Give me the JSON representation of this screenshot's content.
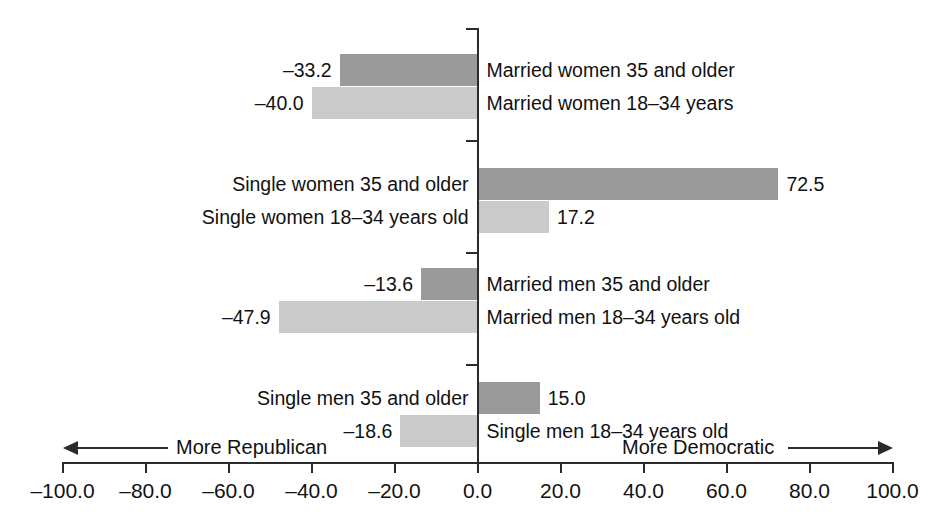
{
  "chart_data": {
    "type": "bar",
    "title": "",
    "subtitle": "",
    "xlabel": "",
    "ylabel": "",
    "orientation": "horizontal",
    "grid": false,
    "legend": "none",
    "xlim": [
      -100.0,
      100.0
    ],
    "xticks": [
      "-100.0",
      "-80.0",
      "-60.0",
      "-40.0",
      "-20.0",
      "0.0",
      "20.0",
      "40.0",
      "60.0",
      "80.0",
      "100.0"
    ],
    "xtick_values": [
      -100,
      -80,
      -60,
      -40,
      -20,
      0,
      20,
      40,
      60,
      80,
      100
    ],
    "axis_direction_left": "More Republican",
    "axis_direction_right": "More Democratic",
    "colors": {
      "older_bar": "#9a9a9a",
      "younger_bar": "#cbcbcb",
      "axis": "#2b2b2b",
      "text": "#111111",
      "background": "#ffffff"
    },
    "series": [
      {
        "name": "35 and older",
        "shade": "dark"
      },
      {
        "name": "18-34 years",
        "shade": "light"
      }
    ],
    "groups": [
      {
        "group": "Married women",
        "bars": [
          {
            "category": "Married women 35 and older",
            "value": -33.2,
            "value_label": "–33.2",
            "shade": "dark"
          },
          {
            "category": "Married women 18–34 years",
            "value": -40.0,
            "value_label": "–40.0",
            "shade": "light"
          }
        ]
      },
      {
        "group": "Single women",
        "bars": [
          {
            "category": "Single women 35 and older",
            "value": 72.5,
            "value_label": "72.5",
            "shade": "dark"
          },
          {
            "category": "Single women 18–34 years old",
            "value": 17.2,
            "value_label": "17.2",
            "shade": "light"
          }
        ]
      },
      {
        "group": "Married men",
        "bars": [
          {
            "category": "Married men 35 and older",
            "value": -13.6,
            "value_label": "–13.6",
            "shade": "dark"
          },
          {
            "category": "Married men 18–34 years old",
            "value": -47.9,
            "value_label": "–47.9",
            "shade": "light"
          }
        ]
      },
      {
        "group": "Single men",
        "bars": [
          {
            "category": "Single men 35 and older",
            "value": 15.0,
            "value_label": "15.0",
            "shade": "dark"
          },
          {
            "category": "Single men 18–34 years old",
            "value": -18.6,
            "value_label": "–18.6",
            "shade": "light"
          }
        ]
      }
    ],
    "categories": [
      "Married women 35 and older",
      "Married women 18–34 years",
      "Single women 35 and older",
      "Single women 18–34 years old",
      "Married men 35 and older",
      "Married men 18–34 years old",
      "Single men 35 and older",
      "Single men 18–34 years old"
    ],
    "values": [
      -33.2,
      -40.0,
      72.5,
      17.2,
      -13.6,
      -47.9,
      15.0,
      -18.6
    ]
  },
  "axis": {
    "ticks": [
      {
        "label": "-100.0"
      },
      {
        "label": "-80.0"
      },
      {
        "label": "-60.0"
      },
      {
        "label": "-40.0"
      },
      {
        "label": "-20.0"
      },
      {
        "label": "0.0"
      },
      {
        "label": "20.0"
      },
      {
        "label": "40.0"
      },
      {
        "label": "60.0"
      },
      {
        "label": "80.0"
      },
      {
        "label": "100.0"
      }
    ],
    "left_direction_label": "More Republican",
    "right_direction_label": "More Democratic"
  }
}
